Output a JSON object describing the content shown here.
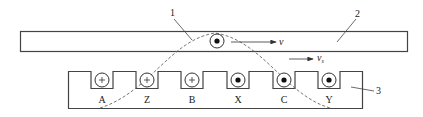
{
  "diagram": {
    "type": "linear-motor-traveling-field",
    "callouts": [
      {
        "id": "1",
        "label": "1",
        "refers_to": "magnetic-field-wave"
      },
      {
        "id": "2",
        "label": "2",
        "refers_to": "mover-bar"
      },
      {
        "id": "3",
        "label": "3",
        "refers_to": "stator-core"
      }
    ],
    "mover": {
      "conductor_symbol": "dot",
      "velocity_label": "v"
    },
    "field_velocity_label": "v",
    "field_velocity_subscript": "s",
    "slots": [
      {
        "label": "A",
        "symbol": "plus"
      },
      {
        "label": "Z",
        "symbol": "plus"
      },
      {
        "label": "B",
        "symbol": "plus"
      },
      {
        "label": "X",
        "symbol": "dot"
      },
      {
        "label": "C",
        "symbol": "dot"
      },
      {
        "label": "Y",
        "symbol": "dot"
      }
    ],
    "colors": {
      "stroke": "#333333",
      "dashed": "#666666",
      "background": "#ffffff"
    }
  }
}
